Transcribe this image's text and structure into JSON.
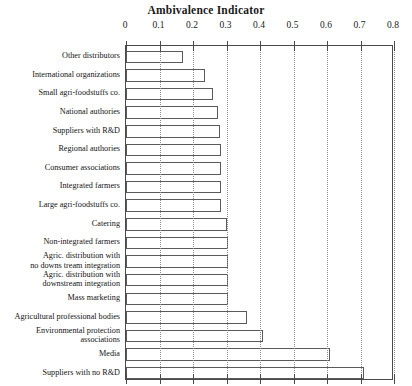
{
  "chart_data": {
    "type": "bar",
    "orientation": "horizontal",
    "title": "Ambivalence Indicator",
    "xlabel": "",
    "ylabel": "",
    "xlim": [
      0,
      0.8
    ],
    "xticks": [
      "0",
      "0.1",
      "0.2",
      "0.3",
      "0.4",
      "0.5",
      "0.6",
      "0.7",
      "0.8"
    ],
    "xtick_values": [
      0,
      0.1,
      0.2,
      0.3,
      0.4,
      0.5,
      0.6,
      0.7,
      0.8
    ],
    "grid": "vertical dotted gridlines at each 0.1 tick",
    "legend": null,
    "bar_fill": "#ffffff",
    "bar_edge": "#5a5a5a",
    "categories": [
      "Other distributors",
      "International organizations",
      "Small agri-foodstuffs co.",
      "National authories",
      "Suppliers with R&D",
      "Regional authories",
      "Consumer associations",
      "Integrated farmers",
      "Large agri-foodstuffs co.",
      "Catering",
      "Non-integrated farmers",
      "Agric. distribution with\nno downs tream integration",
      "Agric. distribution with\ndownstream integration",
      "Mass marketing",
      "Agricultural professional bodies",
      "Environmental protection\nassociations",
      "Media",
      "Suppliers with no R&D"
    ],
    "values": [
      0.17,
      0.235,
      0.26,
      0.275,
      0.28,
      0.285,
      0.285,
      0.285,
      0.285,
      0.3,
      0.305,
      0.305,
      0.305,
      0.305,
      0.36,
      0.41,
      0.61,
      0.71
    ]
  }
}
